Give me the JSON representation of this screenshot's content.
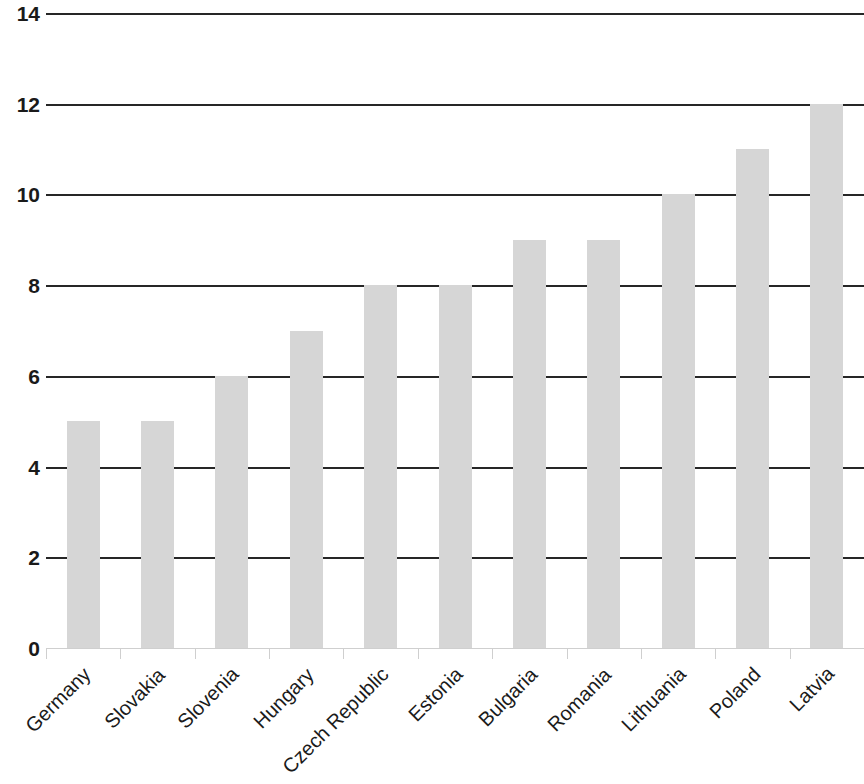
{
  "chart_data": {
    "type": "bar",
    "title": "",
    "subtitle": "",
    "xlabel": "",
    "ylabel": "",
    "categories": [
      "Germany",
      "Slovakia",
      "Slovenia",
      "Hungary",
      "Czech Republic",
      "Estonia",
      "Bulgaria",
      "Romania",
      "Lithuania",
      "Poland",
      "Latvia"
    ],
    "values": [
      5,
      5,
      6,
      7,
      8,
      8,
      9,
      9,
      10,
      11,
      12
    ],
    "ylim": [
      0,
      14
    ],
    "ytick_labels": [
      "0",
      "2",
      "4",
      "6",
      "8",
      "10",
      "12",
      "14"
    ],
    "ytick_values": [
      0,
      2,
      4,
      6,
      8,
      10,
      12,
      14
    ],
    "grid": true,
    "grid_axis": "y",
    "legend": false,
    "legend_position": "none",
    "annotations": [],
    "colors": {
      "bar_fill": "#d6d6d6",
      "gridline": "#262626",
      "axis_line": "#cfcfcf",
      "text": "#1a1a1a",
      "background": "#ffffff"
    }
  }
}
